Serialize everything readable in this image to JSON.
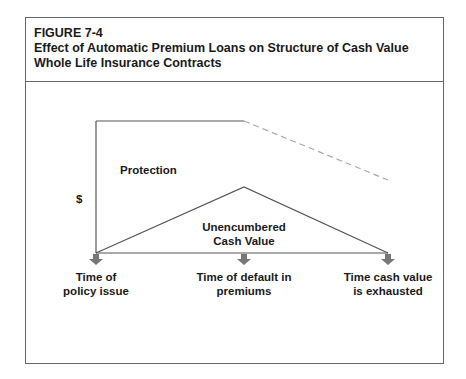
{
  "figure": {
    "number": "FIGURE 7-4",
    "title_line1": "Effect of Automatic Premium Loans on Structure of Cash Value",
    "title_line2": "Whole Life Insurance Contracts"
  },
  "diagram": {
    "y_axis_label": "$",
    "regions": {
      "protection": "Protection",
      "cash_value_line1": "Unencumbered",
      "cash_value_line2": "Cash Value"
    },
    "timeline": [
      {
        "line1": "Time of",
        "line2": "policy issue"
      },
      {
        "line1": "Time of default in",
        "line2": "premiums"
      },
      {
        "line1": "Time cash value",
        "line2": "is exhausted"
      }
    ],
    "colors": {
      "line": "#555555",
      "dashed": "#aaaaaa",
      "arrow": "#777777",
      "border": "#666666"
    }
  }
}
